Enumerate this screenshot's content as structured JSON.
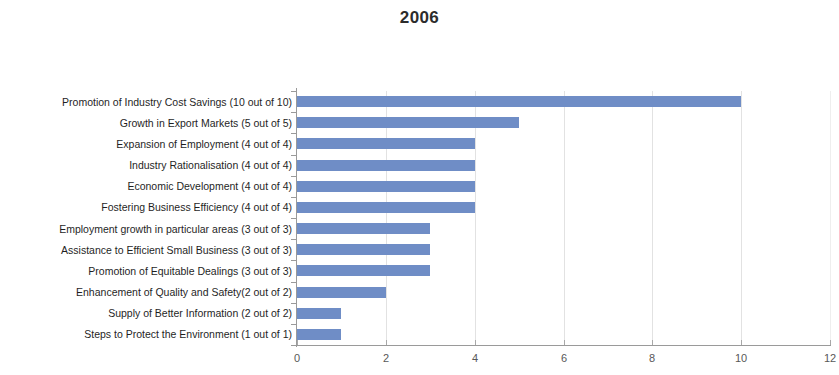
{
  "chart_data": {
    "type": "bar",
    "orientation": "horizontal",
    "title": "2006",
    "xlabel": "",
    "ylabel": "",
    "xlim": [
      0,
      12
    ],
    "xticks": [
      0,
      2,
      4,
      6,
      8,
      10,
      12
    ],
    "grid": true,
    "grid_axis": "x",
    "legend": false,
    "bar_color": "#6f8dc6",
    "categories": [
      "Promotion of Industry Cost Savings (10 out of 10)",
      "Growth in Export Markets (5 out of 5)",
      "Expansion of Employment (4 out of 4)",
      "Industry Rationalisation  (4 out of 4)",
      "Economic Development (4 out of 4)",
      "Fostering Business Efficiency (4 out of 4)",
      "Employment growth in particular areas (3 out of 3)",
      "Assistance to Efficient Small Business (3 out of 3)",
      "Promotion of Equitable Dealings (3 out of 3)",
      "Enhancement of Quality and Safety(2 out of 2)",
      "Supply of Better Information (2 out of 2)",
      "Steps to Protect the Environment (1 out of 1)"
    ],
    "values": [
      10,
      5,
      4,
      4,
      4,
      4,
      3,
      3,
      3,
      2,
      1,
      1
    ]
  }
}
